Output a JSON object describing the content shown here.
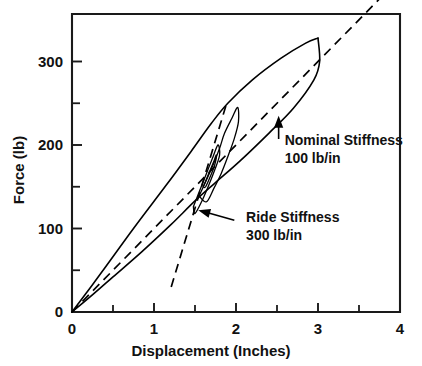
{
  "chart_data": {
    "type": "line",
    "title": "",
    "xlabel": "Displacement (Inches)",
    "ylabel": "Force (lb)",
    "xlim": [
      0,
      4
    ],
    "ylim": [
      0,
      340
    ],
    "grid": false,
    "legend": "none",
    "x_ticks": [
      0,
      1,
      2,
      3,
      4
    ],
    "x_tick_labels": [
      "0",
      "1",
      "2",
      "3",
      "4"
    ],
    "x_minor_ticks": [
      0.5,
      1.5,
      2.5,
      3.5
    ],
    "y_ticks": [
      0,
      100,
      200,
      300
    ],
    "y_tick_labels": [
      "0",
      "100",
      "200",
      "300"
    ],
    "y_minor_ticks": [
      50,
      150,
      250
    ],
    "series": [
      {
        "name": "Nominal Stiffness",
        "style": "dashed",
        "slope_lb_per_in": 100,
        "points": [
          [
            0,
            0
          ],
          [
            3.95,
            395
          ]
        ]
      },
      {
        "name": "Ride Stiffness",
        "style": "dashed",
        "slope_lb_per_in": 300,
        "points": [
          [
            1.21,
            30
          ],
          [
            1.88,
            248
          ]
        ]
      },
      {
        "name": "Hysteresis Loop Upper Branch",
        "style": "solid",
        "points": [
          [
            0,
            0
          ],
          [
            0.35,
            46
          ],
          [
            0.75,
            100
          ],
          [
            1.15,
            152
          ],
          [
            1.45,
            192
          ],
          [
            1.7,
            226
          ],
          [
            1.9,
            250
          ],
          [
            2.2,
            278
          ],
          [
            2.55,
            304
          ],
          [
            2.85,
            322
          ],
          [
            3.0,
            328
          ]
        ]
      },
      {
        "name": "Hysteresis Loop Lower Branch",
        "style": "solid",
        "points": [
          [
            3.0,
            328
          ],
          [
            3.02,
            300
          ],
          [
            2.95,
            278
          ],
          [
            2.7,
            244
          ],
          [
            2.4,
            214
          ],
          [
            2.05,
            181
          ],
          [
            1.75,
            155
          ],
          [
            1.5,
            133
          ],
          [
            1.2,
            104
          ],
          [
            0.85,
            72
          ],
          [
            0.5,
            42
          ],
          [
            0.22,
            18
          ],
          [
            0,
            0
          ]
        ]
      },
      {
        "name": "Inner Sub-loop A",
        "style": "solid",
        "points": [
          [
            1.55,
            139
          ],
          [
            1.63,
            156
          ],
          [
            1.72,
            176
          ],
          [
            1.8,
            196
          ],
          [
            1.86,
            214
          ],
          [
            1.95,
            232
          ],
          [
            2.02,
            245
          ],
          [
            2.03,
            228
          ],
          [
            1.98,
            208
          ],
          [
            1.9,
            186
          ],
          [
            1.82,
            166
          ],
          [
            1.73,
            148
          ],
          [
            1.64,
            132
          ],
          [
            1.55,
            139
          ]
        ]
      },
      {
        "name": "Inner Sub-loop B",
        "style": "solid",
        "points": [
          [
            1.48,
            126
          ],
          [
            1.56,
            146
          ],
          [
            1.64,
            166
          ],
          [
            1.72,
            186
          ],
          [
            1.78,
            200
          ],
          [
            1.8,
            188
          ],
          [
            1.74,
            170
          ],
          [
            1.66,
            150
          ],
          [
            1.58,
            132
          ],
          [
            1.5,
            118
          ],
          [
            1.48,
            126
          ]
        ]
      },
      {
        "name": "Inner Sub-loop C",
        "style": "solid",
        "points": [
          [
            1.6,
            150
          ],
          [
            1.66,
            164
          ],
          [
            1.72,
            178
          ],
          [
            1.76,
            188
          ],
          [
            1.74,
            176
          ],
          [
            1.69,
            163
          ],
          [
            1.63,
            150
          ],
          [
            1.6,
            150
          ]
        ]
      }
    ],
    "annotations": [
      {
        "id": "nominal-stiffness",
        "line1": "Nominal Stiffness",
        "line2": "100 lb/in",
        "text_x": 2.52,
        "text_y": 200,
        "arrow_tip_x": 2.52,
        "arrow_tip_y": 235
      },
      {
        "id": "ride-stiffness",
        "line1": "Ride Stiffness",
        "line2": "300 lb/in",
        "text_x": 2.05,
        "text_y": 108,
        "arrow_tip_x": 1.54,
        "arrow_tip_y": 122
      }
    ]
  }
}
